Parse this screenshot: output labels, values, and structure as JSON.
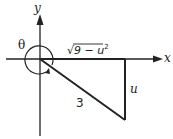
{
  "diagram": {
    "axes": {
      "x_label": "x",
      "y_label": "y"
    },
    "angle_label": "θ",
    "hypotenuse_label": "3",
    "vertical_side_label": "u",
    "horizontal_side_label": {
      "radical": "√",
      "radicand": "9 − u",
      "exponent": "2"
    },
    "colors": {
      "stroke": "#222222",
      "background": "#ffffff"
    }
  }
}
